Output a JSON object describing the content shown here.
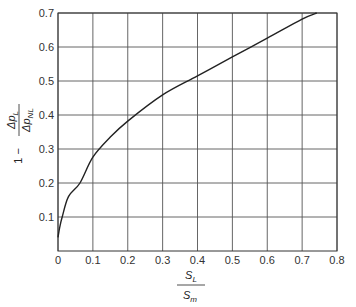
{
  "chart_data": {
    "type": "line",
    "title": "",
    "xlabel": "S_L / S_m",
    "ylabel": "1 − Δp_L / Δp_NL",
    "xlabel_parts": {
      "num": "S",
      "num_sub": "L",
      "den": "S",
      "den_sub": "m"
    },
    "ylabel_parts": {
      "prefix": "1 −",
      "num": "Δp",
      "num_sub": "L",
      "den": "Δp",
      "den_sub": "NL"
    },
    "xlim": [
      0,
      0.8
    ],
    "ylim": [
      0,
      0.7
    ],
    "x_ticks": [
      "0",
      "0.1",
      "0.2",
      "0.3",
      "0.4",
      "0.5",
      "0.6",
      "0.7",
      "0.8"
    ],
    "y_ticks": [
      "0.1",
      "0.2",
      "0.3",
      "0.4",
      "0.5",
      "0.6",
      "0.7"
    ],
    "grid": true,
    "legend": null,
    "series": [
      {
        "name": "curve",
        "x": [
          0,
          0.005,
          0.012,
          0.03,
          0.063,
          0.1,
          0.15,
          0.2,
          0.3,
          0.4,
          0.5,
          0.6,
          0.7,
          0.742
        ],
        "y": [
          0.04,
          0.07,
          0.1,
          0.16,
          0.2,
          0.276,
          0.335,
          0.382,
          0.459,
          0.515,
          0.571,
          0.626,
          0.682,
          0.7
        ]
      }
    ]
  }
}
